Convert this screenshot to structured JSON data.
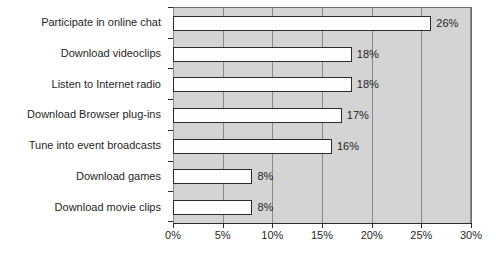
{
  "chart_data": {
    "type": "bar",
    "orientation": "horizontal",
    "title": "",
    "subtitle": "",
    "xlabel": "",
    "ylabel": "",
    "categories": [
      "Participate in online chat",
      "Download videoclips",
      "Listen to Internet radio",
      "Download Browser plug-ins",
      "Tune into event broadcasts",
      "Download games",
      "Download movie clips"
    ],
    "values": [
      26,
      18,
      18,
      17,
      16,
      8,
      8
    ],
    "value_labels": [
      "26%",
      "18%",
      "18%",
      "17%",
      "16%",
      "8%",
      "8%"
    ],
    "xlim": [
      0,
      30
    ],
    "x_tick_values": [
      0,
      5,
      10,
      15,
      20,
      25,
      30
    ],
    "x_tick_labels": [
      "0%",
      "5%",
      "10%",
      "15%",
      "20%",
      "25%",
      "30%"
    ],
    "grid": true,
    "grid_axis": "x",
    "legend": false,
    "legend_position": "none",
    "colors": {
      "bar_fill": "#fdfdfd",
      "bar_border": "#2b2b2b",
      "plot_background": "#d4d4d4",
      "gridline": "#8a8a8a",
      "axis": "#2b2b2b",
      "text": "#1f1f1f",
      "figure_background": "#ffffff"
    }
  }
}
